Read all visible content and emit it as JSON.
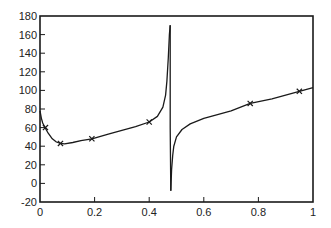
{
  "chart_data": {
    "type": "line",
    "title": "",
    "xlabel": "",
    "ylabel": "",
    "xlim": [
      0,
      1
    ],
    "ylim": [
      -20,
      180
    ],
    "grid": false,
    "x_ticks": [
      0,
      0.2,
      0.4,
      0.6,
      0.8,
      1
    ],
    "x_tick_labels": [
      "0",
      "0.2",
      "0.4",
      "0.6",
      "0.8",
      "1"
    ],
    "y_ticks": [
      -20,
      0,
      20,
      40,
      60,
      80,
      100,
      120,
      140,
      160,
      180
    ],
    "y_tick_labels": [
      "-20",
      "0",
      "20",
      "40",
      "60",
      "80",
      "100",
      "120",
      "140",
      "160",
      "180"
    ],
    "series": [
      {
        "name": "curve",
        "style": "solid",
        "color": "#1a1a1a",
        "x": [
          0.0,
          0.005,
          0.01,
          0.02,
          0.03,
          0.045,
          0.06,
          0.075,
          0.09,
          0.12,
          0.15,
          0.19,
          0.25,
          0.3,
          0.35,
          0.4,
          0.43,
          0.45,
          0.46,
          0.465,
          0.47,
          0.474,
          0.477
        ],
        "y": [
          78,
          70,
          65,
          59,
          54,
          48,
          44.5,
          43,
          42.5,
          44,
          46,
          48,
          53,
          57,
          61,
          66,
          72,
          82,
          95,
          110,
          135,
          160,
          170
        ]
      },
      {
        "name": "curve-drop",
        "style": "solid",
        "color": "#1a1a1a",
        "x": [
          0.477,
          0.477,
          0.479
        ],
        "y": [
          170,
          60,
          -8
        ]
      },
      {
        "name": "curve-right",
        "style": "solid",
        "color": "#1a1a1a",
        "x": [
          0.479,
          0.482,
          0.486,
          0.49,
          0.5,
          0.52,
          0.55,
          0.6,
          0.65,
          0.7,
          0.77,
          0.85,
          0.95,
          1.0
        ],
        "y": [
          -8,
          15,
          30,
          40,
          50,
          58,
          64,
          70,
          74,
          78,
          86,
          91,
          99,
          103
        ]
      }
    ],
    "markers": {
      "symbol": "x",
      "x": [
        0.02,
        0.075,
        0.19,
        0.4,
        0.77,
        0.95
      ],
      "y": [
        60,
        43,
        48,
        66,
        86,
        99
      ]
    }
  }
}
